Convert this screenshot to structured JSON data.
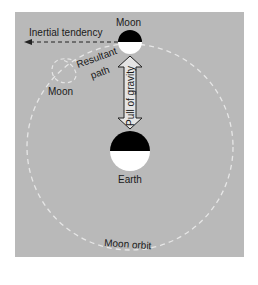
{
  "diagram": {
    "colors": {
      "background": "#b9b9b9",
      "orbit": "#e6e6e6",
      "body_dark": "#000000",
      "body_light": "#ffffff",
      "text": "#1a1a1a"
    },
    "labels": {
      "moon_top": "Moon",
      "inertial": "Inertial tendency",
      "resultant": "Resultant",
      "path": "path",
      "moon_left": "Moon",
      "gravity": "Pull of gravity",
      "earth": "Earth",
      "orbit": "Moon orbit"
    }
  }
}
